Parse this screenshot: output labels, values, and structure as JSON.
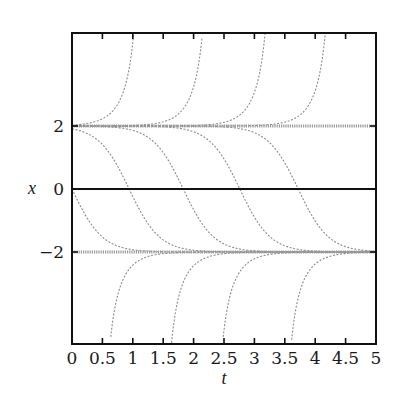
{
  "chart_data": {
    "type": "line",
    "title": "",
    "xlabel": "t",
    "ylabel": "x",
    "xlim": [
      0,
      5
    ],
    "ylim": [
      -5,
      5
    ],
    "x_ticks": [
      0,
      0.5,
      1,
      1.5,
      2,
      2.5,
      3,
      3.5,
      4,
      4.5,
      5
    ],
    "x_tick_labels": [
      "0",
      "0.5",
      "1",
      "1.5",
      "2",
      "2.5",
      "3",
      "3.5",
      "4",
      "4.5",
      "5"
    ],
    "y_ticks": [
      -2,
      0,
      2
    ],
    "y_tick_labels": [
      "−2",
      "0",
      "2"
    ],
    "grid": false,
    "legend": null,
    "model": "dx/dt = x^2 - 4",
    "equilibria": [
      {
        "name": "x = 2",
        "value": 2,
        "style": "thick dotted gray"
      },
      {
        "name": "x = 0",
        "value": 0,
        "style": "solid black reference line"
      },
      {
        "name": "x = -2",
        "value": -2,
        "style": "thick dotted gray"
      }
    ],
    "series": [
      {
        "name": "above 2 (blow up, 1)",
        "branch": "upper",
        "c": 1.23,
        "exits_top_at_t": 1.02
      },
      {
        "name": "above 2 (blow up, 2)",
        "branch": "upper",
        "c": 2.36,
        "exits_top_at_t": 2.15
      },
      {
        "name": "above 2 (blow up, 3)",
        "branch": "upper",
        "c": 3.39,
        "exits_top_at_t": 3.18
      },
      {
        "name": "above 2 (blow up, 4)",
        "branch": "upper",
        "c": 4.38,
        "exits_top_at_t": 4.17
      },
      {
        "name": "between (2 to -2, 1)",
        "branch": "middle",
        "c": 0.0,
        "crosses_zero_at_t": 0.0
      },
      {
        "name": "between (2 to -2, 2)",
        "branch": "middle",
        "c": 0.94,
        "crosses_zero_at_t": 0.94
      },
      {
        "name": "between (2 to -2, 3)",
        "branch": "middle",
        "c": 1.83,
        "crosses_zero_at_t": 1.83
      },
      {
        "name": "between (2 to -2, 4)",
        "branch": "middle",
        "c": 2.76,
        "crosses_zero_at_t": 2.76
      },
      {
        "name": "between (2 to -2, 5)",
        "branch": "middle",
        "c": 3.72,
        "crosses_zero_at_t": 3.72
      },
      {
        "name": "below -2 (rise, 1)",
        "branch": "lower",
        "c": 0.41,
        "enters_bottom_at_t": 0.62
      },
      {
        "name": "below -2 (rise, 2)",
        "branch": "lower",
        "c": 1.42,
        "enters_bottom_at_t": 1.63
      },
      {
        "name": "below -2 (rise, 3)",
        "branch": "lower",
        "c": 2.26,
        "enters_bottom_at_t": 2.47
      },
      {
        "name": "below -2 (rise, 4)",
        "branch": "lower",
        "c": 3.39,
        "enters_bottom_at_t": 3.6
      }
    ]
  },
  "layout": {
    "plot_left": 72,
    "plot_right": 376,
    "plot_top": 33,
    "plot_bottom": 344,
    "y_min": -4.9,
    "y_max": 4.95,
    "y_zero_px": 189,
    "y_px_per_unit": 31.5
  }
}
